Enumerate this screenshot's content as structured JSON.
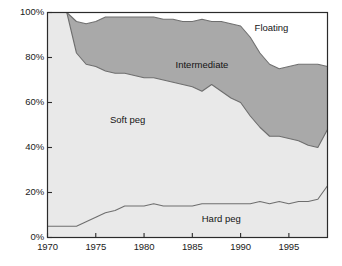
{
  "chart_data": {
    "type": "area",
    "title": "",
    "subtitle": "",
    "xlabel": "",
    "ylabel": "",
    "stacked": true,
    "grid": true,
    "legend_position": "inline-annotations",
    "xlim": [
      1970,
      1999
    ],
    "ylim": [
      0,
      100
    ],
    "x_ticks": [
      1970,
      1975,
      1980,
      1985,
      1990,
      1995
    ],
    "x_tick_labels": [
      "1970",
      "1975",
      "1980",
      "1985",
      "1990",
      "1995"
    ],
    "y_ticks": [
      0,
      20,
      40,
      60,
      80,
      100
    ],
    "y_tick_labels": [
      "0%",
      "20%",
      "40%",
      "60%",
      "80%",
      "100%"
    ],
    "x": [
      1970,
      1971,
      1972,
      1973,
      1974,
      1975,
      1976,
      1977,
      1978,
      1979,
      1980,
      1981,
      1982,
      1983,
      1984,
      1985,
      1986,
      1987,
      1988,
      1989,
      1990,
      1991,
      1992,
      1993,
      1994,
      1995,
      1996,
      1997,
      1998,
      1999
    ],
    "series": [
      {
        "name": "Hard peg",
        "color": "#e9e9e9",
        "values": [
          5,
          5,
          5,
          5,
          7,
          9,
          11,
          12,
          14,
          14,
          14,
          15,
          14,
          14,
          14,
          14,
          15,
          15,
          15,
          15,
          15,
          15,
          16,
          15,
          16,
          15,
          16,
          16,
          17,
          23
        ]
      },
      {
        "name": "Soft peg",
        "color": "#e9e9e9",
        "values": [
          95,
          95,
          95,
          77,
          70,
          67,
          63,
          61,
          59,
          58,
          57,
          56,
          56,
          55,
          54,
          53,
          50,
          53,
          50,
          47,
          45,
          39,
          33,
          30,
          29,
          29,
          27,
          25,
          23,
          25
        ]
      },
      {
        "name": "Intermediate",
        "color": "#a9a9a9",
        "values": [
          0,
          0,
          0,
          14,
          18,
          20,
          24,
          25,
          25,
          26,
          27,
          27,
          27,
          28,
          28,
          29,
          32,
          28,
          31,
          33,
          34,
          35,
          33,
          32,
          30,
          32,
          34,
          36,
          37,
          28
        ]
      },
      {
        "name": "Floating",
        "color": "#ffffff",
        "values": [
          0,
          0,
          0,
          4,
          5,
          4,
          2,
          2,
          2,
          2,
          2,
          2,
          3,
          3,
          4,
          4,
          3,
          4,
          4,
          5,
          6,
          11,
          18,
          23,
          25,
          24,
          23,
          23,
          23,
          24
        ]
      }
    ],
    "annotations": [
      {
        "text": "Floating",
        "x": 1993.2,
        "y": 93.0
      },
      {
        "text": "Intermediate",
        "x": 1986.0,
        "y": 76.5
      },
      {
        "text": "Soft peg",
        "x": 1978.3,
        "y": 52.0
      },
      {
        "text": "Hard peg",
        "x": 1988.0,
        "y": 8.0
      }
    ],
    "colors": {
      "floating": "#ffffff",
      "intermediate": "#a9a9a9",
      "soft_peg": "#e9e9e9",
      "hard_peg": "#e9e9e9",
      "grid": "#cfcfcf",
      "axis": "#2b2b2b",
      "line": "#6e6e6e",
      "text": "#1a1a1a"
    }
  }
}
